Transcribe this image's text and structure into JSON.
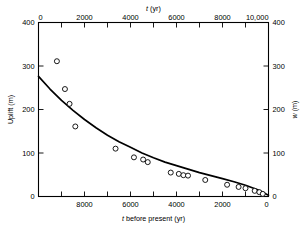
{
  "chart_data": {
    "type": "scatter",
    "title": "",
    "xlabel_top": "t (yr)",
    "xlabel_bottom": "t before present (yr)",
    "ylabel_left": "Uplift (m)",
    "ylabel_right": "w (m)",
    "xlim_top": [
      0,
      10000
    ],
    "xlim_bottom": [
      10000,
      0
    ],
    "ylim": [
      0,
      400
    ],
    "grid": false,
    "legend": "none",
    "axis_top_ticklabels": [
      "0",
      "2000",
      "4000",
      "6000",
      "8000",
      "10,000"
    ],
    "axis_top_tickvalues": [
      0,
      2000,
      4000,
      6000,
      8000,
      10000
    ],
    "axis_top_minor_step": 1000,
    "axis_bottom_ticklabels": [
      "8000",
      "6000",
      "4000",
      "2000",
      "0"
    ],
    "axis_bottom_tickvalues": [
      8000,
      6000,
      4000,
      2000,
      0
    ],
    "axis_bottom_minor_step": 1000,
    "axis_left_ticklabels": [
      "400",
      "300",
      "200",
      "100",
      "0"
    ],
    "axis_left_tickvalues": [
      400,
      300,
      200,
      100,
      0
    ],
    "axis_right_ticklabels": [
      "400",
      "300",
      "200",
      "100",
      "0"
    ],
    "axis_right_tickvalues": [
      400,
      300,
      200,
      100,
      0
    ],
    "marker": "open-circle",
    "series": [
      {
        "name": "Uplift observations",
        "type": "scatter",
        "x": [
          800,
          1150,
          1350,
          1600,
          3350,
          4150,
          4550,
          4750,
          5750,
          6100,
          6300,
          6500,
          7250,
          8200,
          8700,
          9000,
          9400,
          9600,
          9750
        ],
        "y": [
          311,
          247,
          213,
          161,
          110,
          90,
          85,
          79,
          55,
          52,
          49,
          48,
          38,
          27,
          22,
          19,
          13,
          10,
          6
        ]
      },
      {
        "name": "Exponential fit",
        "type": "line",
        "x": [
          0,
          500,
          1000,
          1500,
          2000,
          2500,
          3000,
          3500,
          4000,
          4500,
          5000,
          5500,
          6000,
          6500,
          7000,
          7500,
          8000,
          8500,
          9000,
          9500,
          10000
        ],
        "y": [
          276,
          247,
          221,
          198,
          177,
          158,
          141,
          126,
          113,
          100,
          89,
          79,
          71,
          63,
          55,
          48,
          41,
          34,
          26,
          16,
          3
        ]
      }
    ]
  },
  "figure": {
    "caption": ""
  }
}
